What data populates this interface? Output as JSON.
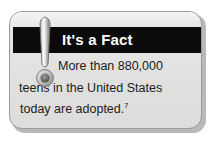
{
  "card": {
    "kind": "fact-callout-box",
    "title": "It's a Fact",
    "icon_name": "exclamation-mark-icon",
    "body_lines": [
      "More than 880,000",
      "teens in the United States",
      "today are adopted."
    ],
    "footnote_marker": "7",
    "full_text": "More than 880,000 teens in the United States today are adopted.",
    "colors": {
      "title_band": "#0b0b0b",
      "title_text": "#ffffff",
      "card_background": "#e4e4e2",
      "card_border": "#9a9a9a",
      "body_text": "#1c1c1c",
      "page_background": "#ffffff",
      "shadow": "#b9b9b9"
    }
  }
}
